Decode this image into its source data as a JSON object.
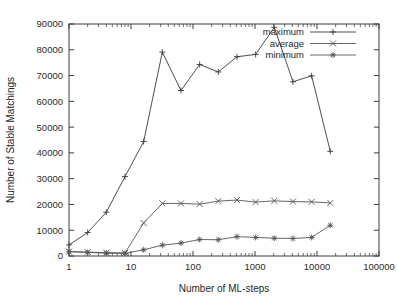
{
  "chart_data": {
    "type": "line",
    "title": "",
    "xlabel": "Number of ML-steps",
    "ylabel": "Number of Stable Matchings",
    "xscale": "log",
    "xlim": [
      1,
      100000
    ],
    "ylim": [
      0,
      90000
    ],
    "grid": false,
    "legend_position": "top-right",
    "xticks": [
      "1",
      "10",
      "100",
      "1000",
      "10000",
      "100000"
    ],
    "xtick_values": [
      1,
      10,
      100,
      1000,
      10000,
      100000
    ],
    "yticks": [
      "0",
      "10000",
      "20000",
      "30000",
      "40000",
      "50000",
      "60000",
      "70000",
      "80000",
      "90000"
    ],
    "ytick_values": [
      0,
      10000,
      20000,
      30000,
      40000,
      50000,
      60000,
      70000,
      80000,
      90000
    ],
    "x": [
      1,
      2,
      4,
      8,
      16,
      32,
      64,
      128,
      256,
      512,
      1024,
      2048,
      4096,
      8192,
      16384
    ],
    "series": [
      {
        "name": "maximum",
        "marker": "plus",
        "color": "#3a3a3a",
        "values": [
          4300,
          9100,
          17000,
          30800,
          44400,
          79100,
          64200,
          74300,
          71400,
          77300,
          78200,
          88700,
          67600,
          69900,
          40600
        ]
      },
      {
        "name": "average",
        "marker": "cross",
        "color": "#555555",
        "values": [
          1700,
          1500,
          1300,
          1200,
          12800,
          20400,
          20400,
          20100,
          21300,
          21700,
          20900,
          21400,
          21100,
          21000,
          20600
        ]
      },
      {
        "name": "minimum",
        "marker": "star",
        "color": "#555555",
        "values": [
          1700,
          1400,
          1100,
          1000,
          2400,
          4200,
          5000,
          6400,
          6300,
          7500,
          7200,
          6900,
          6800,
          7200,
          11900
        ]
      }
    ],
    "average_early_x": [
      1,
      2,
      4,
      8,
      16,
      32
    ],
    "notes": {
      "avg_at_16": 12800,
      "peak_maximum": 88700,
      "peak_maximum_x": 2048,
      "final_maximum": 40600,
      "final_minimum": 11900
    }
  },
  "legend": {
    "entries": [
      {
        "label": "maximum"
      },
      {
        "label": "average"
      },
      {
        "label": "minimum"
      }
    ]
  }
}
